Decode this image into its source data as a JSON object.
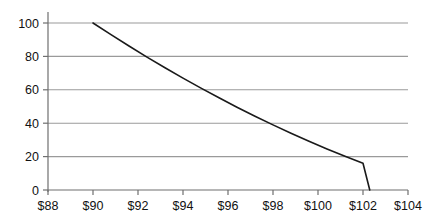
{
  "chart_data": {
    "type": "line",
    "title": "",
    "subtitle": "",
    "xlabel": "",
    "ylabel": "",
    "xlim": [
      88,
      104
    ],
    "ylim": [
      0,
      100
    ],
    "grid": true,
    "grid_axis": "y",
    "legend": false,
    "legend_position": "none",
    "x_tick_labels": [
      "$88",
      "$90",
      "$92",
      "$94",
      "$96",
      "$98",
      "$100",
      "$102",
      "$104"
    ],
    "x_tick_values": [
      88,
      90,
      92,
      94,
      96,
      98,
      100,
      102,
      104
    ],
    "y_tick_labels": [
      "0",
      "20",
      "40",
      "60",
      "80",
      "100"
    ],
    "y_tick_values": [
      0,
      20,
      40,
      60,
      80,
      100
    ],
    "series": [
      {
        "name": "",
        "color": "#1a1a1a",
        "x": [
          90.0,
          90.8,
          91.6,
          92.4,
          93.2,
          94.0,
          94.8,
          95.6,
          96.4,
          97.2,
          98.0,
          98.8,
          99.6,
          100.4,
          101.2,
          102.0,
          102.3
        ],
        "values": [
          100.0,
          93.0,
          86.2,
          79.6,
          73.2,
          67.0,
          61.0,
          55.2,
          49.6,
          44.2,
          39.0,
          34.0,
          29.2,
          24.6,
          20.2,
          16.0,
          0.0
        ]
      }
    ],
    "annotations": []
  },
  "style": {
    "background": "#ffffff",
    "grid_color": "#9a9a9a",
    "axis_color": "#6f6f6f",
    "line_color": "#1a1a1a",
    "tick_label_color": "#111111"
  }
}
